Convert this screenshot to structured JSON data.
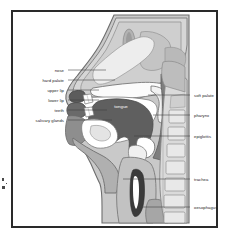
{
  "figure": {
    "frame_color": "#2a2a2a",
    "background_color": "#ffffff"
  },
  "palette": {
    "skin_outline": "#6e6e6e",
    "skin_fill": "#c9c9c9",
    "tissue_light": "#dcdcdc",
    "tissue_mid": "#b4b4b4",
    "tissue_dark": "#7d7d7d",
    "cavity_white": "#fdfdfd",
    "tongue_fill": "#5f5f5f",
    "lip_dark": "#585858",
    "bone_fill": "#d9d9d9",
    "leader_line": "#3a3a3a",
    "label_text": "#1d1d1d",
    "inner_label_text": "#ffffff"
  },
  "labels": {
    "left": [
      {
        "id": "nose",
        "text": "nose",
        "text_x": 62,
        "text_y": 68,
        "line_x1": 65,
        "line_x2": 103,
        "line_y": 68
      },
      {
        "id": "hard-palate",
        "text": "hard palate",
        "text_x": 62,
        "text_y": 78,
        "line_x1": 65,
        "line_x2": 112,
        "line_y": 78
      },
      {
        "id": "upper-lip",
        "text": "upper lip",
        "text_x": 62,
        "text_y": 88,
        "line_x1": 65,
        "line_x2": 96,
        "line_y": 88
      },
      {
        "id": "lower-lip",
        "text": "lower lip",
        "text_x": 62,
        "text_y": 98,
        "line_x1": 65,
        "line_x2": 96,
        "line_y": 98
      },
      {
        "id": "teeth",
        "text": "teeth",
        "text_x": 62,
        "text_y": 108,
        "line_x1": 65,
        "line_x2": 104,
        "line_y": 108
      },
      {
        "id": "salivary-glands",
        "text": "salivary glands",
        "text_x": 62,
        "text_y": 118,
        "line_x1": 65,
        "line_x2": 109,
        "line_y": 118
      }
    ],
    "right": [
      {
        "id": "soft-palate",
        "text": "soft palate",
        "text_x": 190,
        "text_y": 93,
        "line_x1": 145,
        "line_x2": 187,
        "line_y": 93
      },
      {
        "id": "pharynx",
        "text": "pharynx",
        "text_x": 190,
        "text_y": 113,
        "line_x1": 150,
        "line_x2": 187,
        "line_y": 113
      },
      {
        "id": "epiglottis",
        "text": "epiglottis",
        "text_x": 190,
        "text_y": 134,
        "line_x1": 131,
        "line_x2": 187,
        "line_y": 134
      },
      {
        "id": "trachea",
        "text": "trachea",
        "text_x": 190,
        "text_y": 177,
        "line_x1": 120,
        "line_x2": 187,
        "line_y": 177
      },
      {
        "id": "oesophagus",
        "text": "oesophagus",
        "text_x": 190,
        "text_y": 205,
        "line_x1": 134,
        "line_x2": 187,
        "line_y": 205
      }
    ],
    "inner": [
      {
        "id": "tongue",
        "text": "tongue",
        "text_x": 113,
        "text_y": 100
      }
    ]
  },
  "anatomy_parts": [
    "nose",
    "hard palate",
    "upper lip",
    "lower lip",
    "teeth",
    "salivary glands",
    "tongue",
    "soft palate",
    "pharynx",
    "epiglottis",
    "trachea",
    "oesophagus"
  ]
}
